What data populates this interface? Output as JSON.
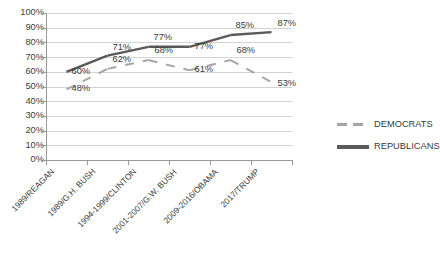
{
  "chart_data": {
    "type": "line",
    "title": "",
    "subtitle": "",
    "xlabel": "",
    "ylabel": "",
    "ylim": [
      0,
      100
    ],
    "ytick_labels": [
      "100%",
      "90%",
      "80%",
      "70%",
      "60%",
      "50%",
      "40%",
      "30%",
      "20%",
      "10%",
      "0%"
    ],
    "ytick_values": [
      100,
      90,
      80,
      70,
      60,
      50,
      40,
      30,
      20,
      10,
      0
    ],
    "grid": true,
    "legend_position": "right",
    "categories": [
      "1989/REAGAN",
      "1989/G.H. BUSH",
      "1994-1999/CLINTON",
      "2001-2007/G.W. BUSH",
      "2009-2016/OBAMA",
      "2017/TRUMP"
    ],
    "series": [
      {
        "name": "DEMOCRATS",
        "color": "#a6a6a6",
        "style": "dashed",
        "values": [
          48,
          62,
          68,
          61,
          68,
          53
        ],
        "data_labels": [
          "48%",
          "62%",
          "68%",
          "61%",
          "68%",
          "53%"
        ]
      },
      {
        "name": "REPUBLICANS",
        "color": "#595959",
        "style": "solid",
        "values": [
          60,
          71,
          77,
          77,
          85,
          87
        ],
        "data_labels": [
          "60%",
          "71%",
          "77%",
          "77%",
          "85%",
          "87%"
        ]
      }
    ]
  },
  "legend": {
    "items": [
      {
        "label": "DEMOCRATS"
      },
      {
        "label": "REPUBLICANS"
      }
    ]
  },
  "colors": {
    "democrats": "#a6a6a6",
    "republicans": "#595959",
    "gridline": "#d2d2d2",
    "axis": "#9a9a9a",
    "text": "#404040",
    "background": "#ffffff"
  }
}
